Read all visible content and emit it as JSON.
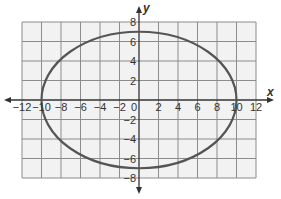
{
  "chart_data": {
    "type": "line",
    "title": "",
    "xlabel": "x",
    "ylabel": "y",
    "xlim": [
      -12,
      12
    ],
    "ylim": [
      -8,
      8
    ],
    "grid": true,
    "grid_step": 2,
    "x_ticks": [
      "-12",
      "-10",
      "-8",
      "-6",
      "-4",
      "-2",
      "0",
      "2",
      "4",
      "6",
      "8",
      "10",
      "12"
    ],
    "y_ticks": [
      "8",
      "6",
      "4",
      "2",
      "-2",
      "-4",
      "-6",
      "-8"
    ],
    "series": [
      {
        "name": "ellipse",
        "equation": "x^2/100 + y^2/49 = 1",
        "center": [
          0,
          0
        ],
        "semi_axis_x": 10,
        "semi_axis_y": 7,
        "vertices": [
          [
            -10,
            0
          ],
          [
            10,
            0
          ],
          [
            0,
            7
          ],
          [
            0,
            -7
          ]
        ],
        "color": "#555555"
      }
    ],
    "colors": {
      "grid_background": "#f2f2f2",
      "grid_line": "#8c8c8c",
      "axis": "#333333",
      "curve": "#555555"
    }
  }
}
